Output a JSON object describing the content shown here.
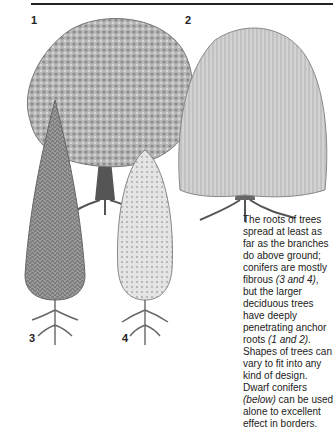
{
  "figure_labels": [
    "1",
    "2",
    "3",
    "4"
  ],
  "caption": {
    "part1": "The roots of trees spread at least as far as the branches do above ground; conifers are mostly fibrous ",
    "ref1": "(3 and 4)",
    "part2": ", but the larger deciduous trees have deeply penetrating anchor roots ",
    "ref2": "(1 and 2)",
    "part3": ". Shapes of trees can vary to fit into any kind of design. Dwarf conifers ",
    "ref3": "(below)",
    "part4": " can be used alone to excellent effect in borders."
  },
  "illustrations": [
    {
      "id": "1",
      "name": "broad deciduous tree"
    },
    {
      "id": "2",
      "name": "weeping deciduous tree"
    },
    {
      "id": "3",
      "name": "tall narrow conifer"
    },
    {
      "id": "4",
      "name": "columnar conifer"
    }
  ]
}
